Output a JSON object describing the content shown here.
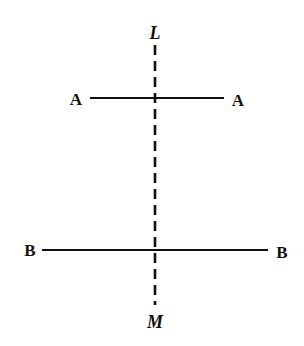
{
  "figure": {
    "width": 304,
    "height": 346,
    "background": "#ffffff",
    "stroke_color": "#111111"
  },
  "axis": {
    "name": "LM",
    "style": "dashed",
    "x": 155,
    "y1": 45,
    "y2": 305,
    "top_label": {
      "text": "L",
      "x": 155,
      "y": 33
    },
    "bottom_label": {
      "text": "M",
      "x": 155,
      "y": 322
    }
  },
  "lines": [
    {
      "name": "AA",
      "y": 98,
      "x1": 90,
      "x2": 224,
      "left_label": {
        "text": "A",
        "x": 76,
        "y": 99
      },
      "right_label": {
        "text": "A",
        "x": 238,
        "y": 100
      }
    },
    {
      "name": "BB",
      "y": 250,
      "x1": 42,
      "x2": 268,
      "left_label": {
        "text": "B",
        "x": 30,
        "y": 250
      },
      "right_label": {
        "text": "B",
        "x": 282,
        "y": 252
      }
    }
  ]
}
